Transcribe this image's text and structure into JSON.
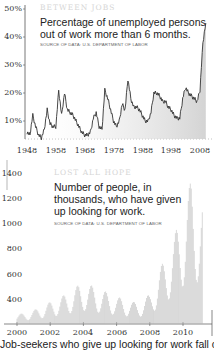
{
  "chart_data": [
    {
      "type": "line",
      "kicker": "BETWEEN JOBS",
      "title": "Percentage of unemployed persons out of work more than 6 months.",
      "source": "SOURCE OF DATA: U.S. Department of Labor",
      "xlabel": "",
      "ylabel": "",
      "y_ticks": [
        "50%",
        "40%",
        "30%",
        "20%",
        "10%"
      ],
      "x_ticks": [
        "1948",
        "1958",
        "1968",
        "1978",
        "1988",
        "1998",
        "2008"
      ],
      "ylim": [
        4,
        50
      ],
      "xlim": [
        1948,
        2010
      ],
      "grid": false,
      "fill_below_line": true,
      "x": [
        1948,
        1949,
        1950,
        1951,
        1952,
        1953,
        1954,
        1955,
        1956,
        1957,
        1958,
        1959,
        1960,
        1961,
        1962,
        1963,
        1964,
        1965,
        1966,
        1967,
        1968,
        1969,
        1970,
        1971,
        1972,
        1973,
        1974,
        1975,
        1976,
        1977,
        1978,
        1979,
        1980,
        1981,
        1982,
        1983,
        1984,
        1985,
        1986,
        1987,
        1988,
        1989,
        1990,
        1991,
        1992,
        1993,
        1994,
        1995,
        1996,
        1997,
        1998,
        1999,
        2000,
        2001,
        2002,
        2003,
        2004,
        2005,
        2006,
        2007,
        2008,
        2009,
        2010
      ],
      "values": [
        6,
        5,
        12,
        8,
        5,
        4,
        7,
        14,
        9,
        8,
        8,
        21,
        12,
        20,
        14,
        13,
        12,
        10,
        8,
        6,
        5,
        5,
        6,
        11,
        13,
        8,
        7,
        21,
        18,
        14,
        10,
        8,
        10,
        16,
        14,
        25,
        18,
        15,
        15,
        14,
        12,
        10,
        10,
        13,
        20,
        20,
        19,
        17,
        17,
        15,
        14,
        12,
        11,
        11,
        18,
        22,
        20,
        19,
        18,
        17,
        21,
        38,
        45
      ]
    },
    {
      "type": "bar",
      "kicker": "LOST ALL HOPE",
      "title": "Number of people, in thousands, who have given up looking for work.",
      "source": "SOURCE OF DATA: U.S. Department of Labor",
      "xlabel": "",
      "ylabel": "",
      "y_ticks": [
        "1400",
        "1200",
        "1000",
        "800",
        "600",
        "400"
      ],
      "x_ticks": [
        "2000",
        "2002",
        "2004",
        "2006",
        "2008",
        "2010"
      ],
      "ylim": [
        200,
        1450
      ],
      "xlim": [
        2000,
        2011.3
      ],
      "grid": false,
      "x": [
        2000.0,
        2000.5,
        2001.0,
        2001.5,
        2002.0,
        2002.5,
        2003.0,
        2003.5,
        2004.0,
        2004.5,
        2005.0,
        2005.5,
        2006.0,
        2006.5,
        2007.0,
        2007.5,
        2008.0,
        2008.5,
        2009.0,
        2009.5,
        2010.0,
        2010.5,
        2011.0
      ],
      "values": [
        270,
        280,
        300,
        330,
        360,
        390,
        420,
        470,
        500,
        480,
        450,
        430,
        400,
        380,
        360,
        370,
        420,
        560,
        720,
        850,
        1050,
        1250,
        1100
      ]
    }
  ],
  "panels": {
    "top": {
      "kicker": "BETWEEN JOBS",
      "headline_line1": "Percentage of unemployed persons",
      "headline_line2": "out of work more than 6 months.",
      "source": "SOURCE OF DATA: U.S. Department of Labor",
      "y_ticks": [
        "50%",
        "40%",
        "30%",
        "20%",
        "10%"
      ],
      "x_ticks": [
        "1948",
        "1958",
        "1968",
        "1978",
        "1988",
        "1998",
        "2008"
      ]
    },
    "bottom": {
      "kicker": "LOST ALL HOPE",
      "headline_line1": "Number of people, in",
      "headline_line2": "thousands, who have given",
      "headline_line3": "up looking for work.",
      "source": "SOURCE OF DATA: U.S. Department of Labor",
      "y_ticks": [
        "1400",
        "1200",
        "1000",
        "800",
        "600",
        "400"
      ],
      "x_ticks": [
        "2000",
        "2002",
        "2004",
        "2006",
        "2008",
        "2010"
      ]
    }
  },
  "caption": "Job-seekers who give up looking for work fall off the"
}
